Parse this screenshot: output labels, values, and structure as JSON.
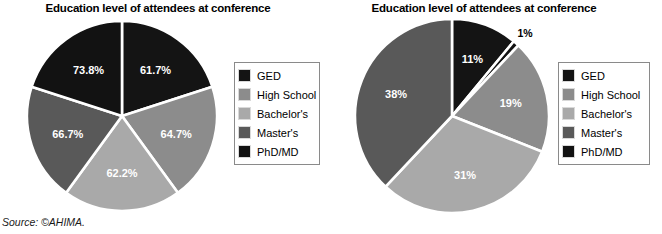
{
  "source_note": "Source: ©AHIMA.",
  "palette": {
    "ged": "#141414",
    "high_school": "#8c8c8c",
    "bachelors": "#a9a9a9",
    "masters": "#595959",
    "phd_md": "#121212",
    "slice_divider": "#ffffff",
    "legend_border": "#8a8a8a",
    "background": "#ffffff",
    "label_light": "#ffffff",
    "label_dark": "#000000"
  },
  "legend": {
    "items": [
      {
        "label": "GED",
        "color": "#141414"
      },
      {
        "label": "High School",
        "color": "#8c8c8c"
      },
      {
        "label": "Bachelor's",
        "color": "#a9a9a9"
      },
      {
        "label": "Master's",
        "color": "#595959"
      },
      {
        "label": "PhD/MD",
        "color": "#121212"
      }
    ]
  },
  "charts": [
    {
      "id": "left",
      "title": "Education level of attendees at conference",
      "labels": [
        "61.7%",
        "64.7%",
        "62.2%",
        "66.7%",
        "73.8%"
      ]
    },
    {
      "id": "right",
      "title": "Education level of attendees at conference",
      "labels": [
        "11%",
        "1%",
        "19%",
        "31%",
        "38%"
      ]
    }
  ],
  "chart_data": [
    {
      "type": "pie",
      "title": "Education level of attendees at conference",
      "categories": [
        "GED",
        "High School",
        "Bachelor's",
        "Master's",
        "PhD/MD"
      ],
      "values": [
        61.7,
        64.7,
        62.2,
        66.7,
        73.8
      ],
      "value_labels": [
        "61.7%",
        "64.7%",
        "62.2%",
        "66.7%",
        "73.8%"
      ],
      "slice_angles_deg": [
        72,
        72,
        72,
        72,
        72
      ],
      "start_angle_deg": 0,
      "note": "Slices are drawn at equal 72-degree widths; printed labels are percentages of each group, not shares of the pie",
      "colors": [
        "#141414",
        "#8c8c8c",
        "#a9a9a9",
        "#595959",
        "#121212"
      ],
      "legend": [
        "GED",
        "High School",
        "Bachelor's",
        "Master's",
        "PhD/MD"
      ],
      "legend_position": "right",
      "grid": false
    },
    {
      "type": "pie",
      "title": "Education level of attendees at conference",
      "categories": [
        "GED",
        "PhD/MD",
        "High School",
        "Bachelor's",
        "Master's"
      ],
      "values": [
        11,
        1,
        19,
        31,
        38
      ],
      "value_labels": [
        "11%",
        "1%",
        "19%",
        "31%",
        "38%"
      ],
      "slice_angles_deg": [
        39.6,
        3.6,
        68.4,
        111.6,
        136.8
      ],
      "start_angle_deg": 0,
      "colors": [
        "#141414",
        "#121212",
        "#8c8c8c",
        "#a9a9a9",
        "#595959"
      ],
      "legend": [
        "GED",
        "High School",
        "Bachelor's",
        "Master's",
        "PhD/MD"
      ],
      "legend_position": "right",
      "grid": false
    }
  ]
}
